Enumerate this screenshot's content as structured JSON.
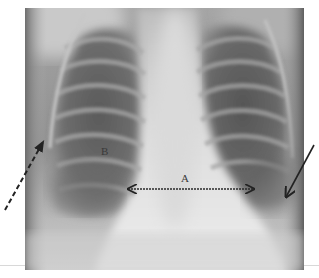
{
  "image": {
    "type": "chest-radiograph",
    "view": "frontal"
  },
  "annotations": {
    "label_a": "A",
    "label_b": "B",
    "arrows": [
      {
        "name": "dashed-arrow",
        "style": "dashed",
        "from": [
          5,
          210
        ],
        "to": [
          44,
          140
        ],
        "color": "#222222"
      },
      {
        "name": "solid-arrow",
        "style": "solid",
        "from": [
          314,
          145
        ],
        "to": [
          285,
          199
        ],
        "color": "#222222"
      },
      {
        "name": "double-arrow-a",
        "style": "dotted",
        "from": [
          126,
          189
        ],
        "to": [
          256,
          189
        ],
        "color": "#222222"
      }
    ]
  },
  "colors": {
    "background": "#ffffff",
    "lung_dark": "#5f5f5f",
    "mediastinum_light": "#e6e6e6"
  }
}
